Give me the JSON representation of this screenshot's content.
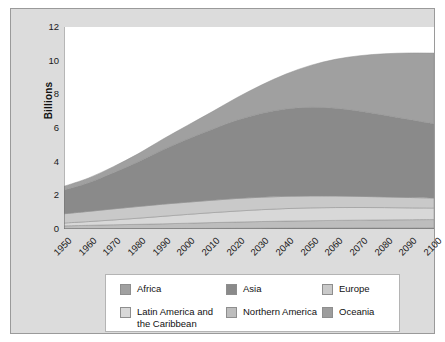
{
  "figure": {
    "background_color": "#dcdcdc",
    "plot_background_color": "#ffffff",
    "border_color": "#9a9a9a"
  },
  "axes": {
    "ylabel": "Billions",
    "y_ticks": [
      "0",
      "2",
      "4",
      "6",
      "8",
      "10",
      "12"
    ],
    "x_ticks": [
      "1950",
      "1960",
      "1970",
      "1980",
      "1990",
      "2000",
      "2010",
      "2020",
      "2030",
      "2040",
      "2050",
      "2060",
      "2070",
      "2080",
      "2090",
      "2100"
    ]
  },
  "legend": {
    "entries": [
      {
        "label": "Africa",
        "color": "#a0a0a0",
        "col": 0,
        "row": 0
      },
      {
        "label": "Asia",
        "color": "#8a8a8a",
        "col": 1,
        "row": 0
      },
      {
        "label": "Europe",
        "color": "#c9c9c9",
        "col": 2,
        "row": 0
      },
      {
        "label": "Latin America and\nthe Caribbean",
        "color": "#d8d8d8",
        "col": 0,
        "row": 1
      },
      {
        "label": "Northern America",
        "color": "#bdbdbd",
        "col": 1,
        "row": 1
      },
      {
        "label": "Oceania",
        "color": "#9d9d9d",
        "col": 2,
        "row": 1
      }
    ]
  },
  "chart_data": {
    "type": "area",
    "stacked": true,
    "title": "",
    "xlabel": "",
    "ylabel": "Billions",
    "xlim": [
      1950,
      2100
    ],
    "ylim": [
      0,
      12
    ],
    "grid": false,
    "legend_position": "bottom",
    "units": "billions of people",
    "x": [
      1950,
      1960,
      1970,
      1980,
      1990,
      2000,
      2010,
      2020,
      2030,
      2040,
      2050,
      2060,
      2070,
      2080,
      2090,
      2100
    ],
    "stack_order_bottom_to_top": [
      "Oceania",
      "Northern America",
      "Latin America and the Caribbean",
      "Europe",
      "Asia",
      "Africa"
    ],
    "series": [
      {
        "name": "Oceania",
        "color": "#9d9d9d",
        "values": [
          0.013,
          0.016,
          0.02,
          0.023,
          0.027,
          0.031,
          0.037,
          0.043,
          0.048,
          0.053,
          0.057,
          0.061,
          0.064,
          0.066,
          0.068,
          0.069
        ]
      },
      {
        "name": "Northern America",
        "color": "#bdbdbd",
        "values": [
          0.173,
          0.204,
          0.231,
          0.254,
          0.28,
          0.313,
          0.343,
          0.369,
          0.395,
          0.417,
          0.435,
          0.45,
          0.462,
          0.473,
          0.483,
          0.491
        ]
      },
      {
        "name": "Latin America and the Caribbean",
        "color": "#d8d8d8",
        "values": [
          0.169,
          0.221,
          0.287,
          0.364,
          0.446,
          0.522,
          0.591,
          0.654,
          0.706,
          0.743,
          0.762,
          0.764,
          0.752,
          0.731,
          0.703,
          0.68
        ]
      },
      {
        "name": "Europe",
        "color": "#c9c9c9",
        "values": [
          0.549,
          0.606,
          0.657,
          0.694,
          0.721,
          0.726,
          0.736,
          0.748,
          0.741,
          0.728,
          0.71,
          0.686,
          0.659,
          0.636,
          0.617,
          0.6
        ]
      },
      {
        "name": "Asia",
        "color": "#8a8a8a",
        "values": [
          1.405,
          1.7,
          2.142,
          2.65,
          3.226,
          3.741,
          4.21,
          4.641,
          4.974,
          5.189,
          5.267,
          5.214,
          5.059,
          4.852,
          4.63,
          4.41
        ]
      },
      {
        "name": "Africa",
        "color": "#a0a0a0",
        "values": [
          0.228,
          0.285,
          0.366,
          0.478,
          0.631,
          0.818,
          1.044,
          1.341,
          1.688,
          2.077,
          2.489,
          2.905,
          3.3,
          3.653,
          3.955,
          4.2
        ]
      }
    ],
    "totals": [
      2.536,
      3.032,
      3.7,
      4.462,
      5.331,
      6.15,
      6.96,
      7.795,
      8.551,
      9.206,
      9.72,
      10.08,
      10.296,
      10.411,
      10.456,
      10.45
    ]
  }
}
